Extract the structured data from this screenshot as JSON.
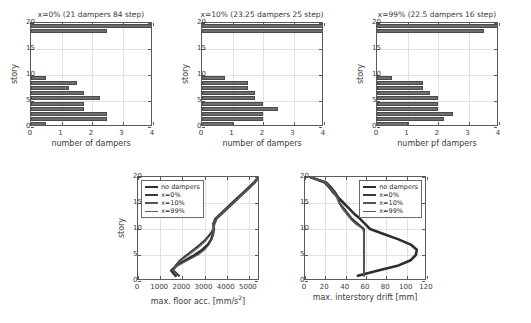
{
  "figure": {
    "background": "#ffffff",
    "line_color": "#3a3a3a",
    "bar_color": "#6e6e6e",
    "grid_color": "#e2e2e2"
  },
  "chart_data": [
    {
      "id": "dampers-x0",
      "type": "bar",
      "orientation": "horizontal",
      "title": "x=0% (21 dampers 84 step)",
      "xlabel": "number of dampers",
      "ylabel": "story",
      "xlim": [
        0,
        4
      ],
      "ylim": [
        0,
        20
      ],
      "xticks": [
        0,
        1,
        2,
        3,
        4
      ],
      "yticks": [
        0,
        5,
        10,
        15,
        20
      ],
      "xticklabels": [
        "0",
        "1",
        "2",
        "3",
        "4"
      ],
      "yticklabels": [
        "0",
        "5",
        "10",
        "15",
        "20"
      ],
      "grid": true,
      "categories": [
        1,
        2,
        3,
        4,
        5,
        6,
        7,
        8,
        9,
        10,
        11,
        12,
        13,
        14,
        15,
        16,
        17,
        18,
        19,
        20
      ],
      "values": [
        0.5,
        2.5,
        2.5,
        1.75,
        1.75,
        2.25,
        1.75,
        1.25,
        1.5,
        0.5,
        0,
        0,
        0,
        0,
        0,
        0,
        0,
        0,
        2.5,
        4.0
      ]
    },
    {
      "id": "dampers-x10",
      "type": "bar",
      "orientation": "horizontal",
      "title": "x=10% (23.25 dampers 25 step)",
      "xlabel": "number of dampers",
      "ylabel": "story",
      "xlim": [
        0,
        4
      ],
      "ylim": [
        0,
        20
      ],
      "xticks": [
        0,
        1,
        2,
        3,
        4
      ],
      "yticks": [
        0,
        5,
        10,
        15,
        20
      ],
      "xticklabels": [
        "0",
        "1",
        "2",
        "3",
        "4"
      ],
      "yticklabels": [
        "0",
        "5",
        "10",
        "15",
        "20"
      ],
      "grid": true,
      "categories": [
        1,
        2,
        3,
        4,
        5,
        6,
        7,
        8,
        9,
        10,
        11,
        12,
        13,
        14,
        15,
        16,
        17,
        18,
        19,
        20
      ],
      "values": [
        1.0,
        2.0,
        2.0,
        2.5,
        2.0,
        1.75,
        1.75,
        1.5,
        1.5,
        0.75,
        0,
        0,
        0,
        0,
        0,
        0,
        0,
        0,
        4.0,
        4.0
      ]
    },
    {
      "id": "dampers-x99",
      "type": "bar",
      "orientation": "horizontal",
      "title": "x=99% (22.5 dampers 16 step)",
      "xlabel": "number pf dampers",
      "ylabel": "story",
      "xlim": [
        0,
        4
      ],
      "ylim": [
        0,
        20
      ],
      "xticks": [
        0,
        1,
        2,
        3,
        4
      ],
      "yticks": [
        0,
        5,
        10,
        15,
        20
      ],
      "xticklabels": [
        "0",
        "1",
        "2",
        "3",
        "4"
      ],
      "yticklabels": [
        "0",
        "5",
        "10",
        "15",
        "20"
      ],
      "grid": true,
      "categories": [
        1,
        2,
        3,
        4,
        5,
        6,
        7,
        8,
        9,
        10,
        11,
        12,
        13,
        14,
        15,
        16,
        17,
        18,
        19,
        20
      ],
      "values": [
        1.0,
        2.2,
        2.5,
        2.0,
        2.0,
        2.0,
        1.75,
        1.5,
        1.5,
        0.5,
        0,
        0,
        0,
        0,
        0,
        0,
        0,
        0,
        3.5,
        4.0
      ]
    },
    {
      "id": "max-floor-acc",
      "type": "line",
      "title": "",
      "xlabel": "max. floor acc. [mm/s²]",
      "ylabel": "story",
      "xlim": [
        0,
        5500
      ],
      "ylim": [
        0,
        20
      ],
      "xticks": [
        0,
        1000,
        2000,
        3000,
        4000,
        5000
      ],
      "yticks": [
        0,
        5,
        10,
        15,
        20
      ],
      "xticklabels": [
        "0",
        "1000",
        "2000",
        "3000",
        "4000",
        "5000"
      ],
      "yticklabels": [
        "0",
        "5",
        "10",
        "15",
        "20"
      ],
      "grid": true,
      "legend_position": "top-left",
      "series": [
        {
          "name": "no dampers",
          "width": 2.6,
          "color": "#2e2e2e",
          "x": [
            1700,
            1500,
            1750,
            2150,
            2550,
            2900,
            3150,
            3300,
            3380,
            3420,
            3400,
            3500,
            3750,
            4000,
            4250,
            4500,
            4750,
            5000,
            5250,
            5450
          ],
          "y": [
            1,
            2,
            3,
            4,
            5,
            6,
            7,
            8,
            9,
            10,
            11,
            12,
            13,
            14,
            15,
            16,
            17,
            18,
            19,
            20
          ]
        },
        {
          "name": "x=0%",
          "width": 2.0,
          "color": "#3a3a3a",
          "x": [
            1850,
            1600,
            1700,
            1900,
            2200,
            2500,
            2800,
            3050,
            3250,
            3400,
            3450,
            3550,
            3800,
            4050,
            4300,
            4550,
            4800,
            5050,
            5280,
            5450
          ],
          "y": [
            1,
            2,
            3,
            4,
            5,
            6,
            7,
            8,
            9,
            10,
            11,
            12,
            13,
            14,
            15,
            16,
            17,
            18,
            19,
            20
          ]
        },
        {
          "name": "x=10%",
          "width": 1.2,
          "color": "#555555",
          "x": [
            1750,
            1550,
            1800,
            2250,
            2700,
            3000,
            3200,
            3320,
            3400,
            3430,
            3420,
            3520,
            3770,
            4020,
            4270,
            4520,
            4770,
            5020,
            5260,
            5450
          ],
          "y": [
            1,
            2,
            3,
            4,
            5,
            6,
            7,
            8,
            9,
            10,
            11,
            12,
            13,
            14,
            15,
            16,
            17,
            18,
            19,
            20
          ]
        },
        {
          "name": "x=99%",
          "width": 1.0,
          "color": "#606060",
          "x": [
            1800,
            1580,
            1720,
            1950,
            2300,
            2620,
            2900,
            3120,
            3300,
            3420,
            3440,
            3540,
            3790,
            4040,
            4290,
            4540,
            4790,
            5040,
            5270,
            5450
          ],
          "y": [
            1,
            2,
            3,
            4,
            5,
            6,
            7,
            8,
            9,
            10,
            11,
            12,
            13,
            14,
            15,
            16,
            17,
            18,
            19,
            20
          ]
        }
      ]
    },
    {
      "id": "max-interstory-drift",
      "type": "line",
      "title": "",
      "xlabel": "max. interstory drift [mm]",
      "ylabel": "",
      "xlim": [
        0,
        120
      ],
      "ylim": [
        0,
        20
      ],
      "xticks": [
        0,
        20,
        40,
        60,
        80,
        100,
        120
      ],
      "yticks": [
        0,
        5,
        10,
        15,
        20
      ],
      "xticklabels": [
        "0",
        "20",
        "40",
        "60",
        "80",
        "100",
        "120"
      ],
      "yticklabels": [
        "0",
        "5",
        "10",
        "15",
        "20"
      ],
      "grid": true,
      "legend_position": "top-right",
      "series": [
        {
          "name": "no dampers",
          "width": 2.6,
          "color": "#2e2e2e",
          "x": [
            52,
            72,
            92,
            104,
            109,
            110,
            104,
            92,
            78,
            64,
            59,
            54,
            48,
            43,
            38,
            33,
            28,
            24,
            19,
            5
          ],
          "y": [
            1,
            2,
            3,
            4,
            5,
            6,
            7,
            8,
            9,
            10,
            11,
            12,
            13,
            14,
            15,
            16,
            17,
            18,
            19,
            20
          ]
        },
        {
          "name": "x=0%",
          "width": 2.0,
          "color": "#3a3a3a",
          "x": [
            58,
            58,
            58,
            58,
            58,
            58,
            58,
            58,
            58,
            58,
            52,
            46,
            42,
            38,
            34,
            33,
            30,
            26,
            21,
            5
          ],
          "y": [
            1,
            2,
            3,
            4,
            5,
            6,
            7,
            8,
            9,
            10,
            11,
            12,
            13,
            14,
            15,
            16,
            17,
            18,
            19,
            20
          ]
        },
        {
          "name": "x=10%",
          "width": 1.2,
          "color": "#555555",
          "x": [
            58,
            58,
            58,
            58,
            58,
            58,
            58,
            58,
            58,
            57,
            50,
            45,
            41,
            37,
            34,
            32,
            29,
            25,
            20,
            5
          ],
          "y": [
            1,
            2,
            3,
            4,
            5,
            6,
            7,
            8,
            9,
            10,
            11,
            12,
            13,
            14,
            15,
            16,
            17,
            18,
            19,
            20
          ]
        },
        {
          "name": "x=99%",
          "width": 1.0,
          "color": "#606060",
          "x": [
            58,
            58,
            58,
            58,
            58,
            58,
            58,
            58,
            58,
            57,
            49,
            44,
            40,
            36,
            33,
            31,
            28,
            24,
            19,
            5
          ],
          "y": [
            1,
            2,
            3,
            4,
            5,
            6,
            7,
            8,
            9,
            10,
            11,
            12,
            13,
            14,
            15,
            16,
            17,
            18,
            19,
            20
          ]
        }
      ]
    }
  ]
}
